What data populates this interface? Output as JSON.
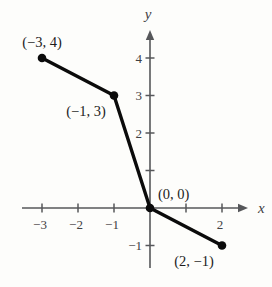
{
  "figure": {
    "background": "#fdfdfb"
  },
  "chart_data": {
    "type": "line",
    "title": "",
    "xlabel": "x",
    "ylabel": "y",
    "x_range": [
      -3.5,
      2.7
    ],
    "y_range": [
      -1.6,
      4.75
    ],
    "grid": false,
    "legend": "none",
    "axis_color": "#56575a",
    "tick_label_color": "#3f4042",
    "point_label_color": "#1c1c1c",
    "series": [
      {
        "name": "polyline-segments",
        "color": "#0b0b0b",
        "points": [
          {
            "x": -3,
            "y": 4,
            "label": "(−3, 4)",
            "label_pos": "above"
          },
          {
            "x": -1,
            "y": 3,
            "label": "(−1, 3)",
            "label_pos": "below-left"
          },
          {
            "x": 0,
            "y": 0,
            "label": "(0, 0)",
            "label_pos": "above-right"
          },
          {
            "x": 2,
            "y": -1,
            "label": "(2, −1)",
            "label_pos": "below-left"
          }
        ]
      }
    ],
    "x_ticks": [
      {
        "value": -3,
        "label": "−3"
      },
      {
        "value": -2,
        "label": "−2"
      },
      {
        "value": -1,
        "label": "−1"
      },
      {
        "value": 1,
        "label": ""
      },
      {
        "value": 2,
        "label": "2"
      }
    ],
    "y_ticks": [
      {
        "value": -1,
        "label": "−1"
      },
      {
        "value": 1,
        "label": ""
      },
      {
        "value": 2,
        "label": "2"
      },
      {
        "value": 3,
        "label": "3"
      },
      {
        "value": 4,
        "label": "4"
      }
    ]
  }
}
